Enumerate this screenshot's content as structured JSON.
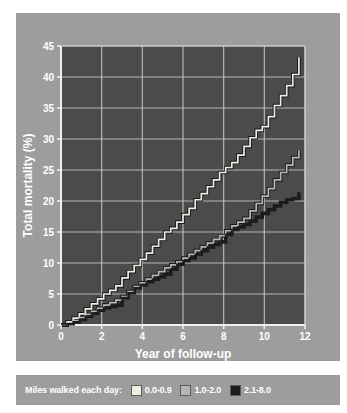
{
  "chart_data": {
    "type": "line",
    "title": "",
    "xlabel": "Year of follow-up",
    "ylabel": "Total mortality (%)",
    "xlim": [
      0,
      12
    ],
    "ylim": [
      0,
      45
    ],
    "xticks": [
      0,
      2,
      4,
      6,
      8,
      10,
      12
    ],
    "yticks": [
      0,
      5,
      10,
      15,
      20,
      25,
      30,
      35,
      40,
      45
    ],
    "grid": true,
    "legend_position": "below",
    "legend_title": "Miles walked each day:",
    "plot_background": "#4b4b4b",
    "panel_background": "#9d9d9d",
    "grid_color": "#c9c9c9",
    "step_interpolation": "step-after",
    "series": [
      {
        "name": "0.0-0.9",
        "color": "#f0ece1",
        "outline_color": "#1a1a1a",
        "x": [
          0.0,
          0.3,
          0.6,
          0.9,
          1.2,
          1.5,
          1.8,
          2.1,
          2.4,
          2.7,
          3.0,
          3.3,
          3.6,
          3.9,
          4.2,
          4.5,
          4.8,
          5.1,
          5.4,
          5.7,
          6.0,
          6.3,
          6.6,
          6.9,
          7.2,
          7.5,
          7.8,
          8.1,
          8.4,
          8.7,
          9.0,
          9.3,
          9.6,
          9.9,
          10.2,
          10.5,
          10.8,
          11.1,
          11.4,
          11.7
        ],
        "y": [
          0.0,
          0.5,
          1.1,
          1.8,
          2.6,
          3.4,
          4.2,
          5.0,
          5.6,
          6.3,
          7.6,
          8.6,
          9.6,
          10.6,
          11.6,
          12.7,
          13.8,
          15.0,
          15.6,
          16.6,
          17.8,
          18.8,
          20.2,
          21.2,
          22.3,
          23.4,
          24.6,
          25.4,
          26.2,
          27.4,
          28.8,
          30.2,
          31.4,
          32.0,
          33.6,
          35.4,
          37.0,
          38.6,
          40.4,
          43.2
        ]
      },
      {
        "name": "1.0-2.0",
        "color": "#b6b6b6",
        "outline_color": "#1a1a1a",
        "x": [
          0.0,
          0.3,
          0.6,
          0.9,
          1.2,
          1.5,
          1.8,
          2.1,
          2.4,
          2.7,
          3.0,
          3.3,
          3.6,
          3.9,
          4.2,
          4.5,
          4.8,
          5.1,
          5.4,
          5.7,
          6.0,
          6.3,
          6.6,
          6.9,
          7.2,
          7.5,
          7.8,
          8.1,
          8.4,
          8.7,
          9.0,
          9.3,
          9.6,
          9.9,
          10.2,
          10.5,
          10.8,
          11.1,
          11.4,
          11.7
        ],
        "y": [
          0.0,
          0.3,
          0.7,
          1.2,
          1.7,
          2.2,
          2.7,
          3.2,
          3.6,
          4.0,
          4.6,
          5.4,
          6.2,
          6.8,
          7.4,
          8.0,
          8.6,
          9.2,
          9.7,
          10.2,
          10.8,
          11.4,
          12.0,
          12.6,
          13.2,
          13.8,
          14.4,
          15.2,
          16.0,
          16.6,
          17.2,
          18.4,
          19.6,
          20.8,
          22.0,
          23.4,
          24.6,
          25.8,
          27.0,
          28.2
        ]
      },
      {
        "name": "2.1-8.0",
        "color": "#1c1c1c",
        "outline_color": "#1c1c1c",
        "x": [
          0.0,
          0.3,
          0.6,
          0.9,
          1.2,
          1.5,
          1.8,
          2.1,
          2.4,
          2.7,
          3.0,
          3.3,
          3.6,
          3.9,
          4.2,
          4.5,
          4.8,
          5.1,
          5.4,
          5.7,
          6.0,
          6.3,
          6.6,
          6.9,
          7.2,
          7.5,
          7.8,
          8.1,
          8.4,
          8.7,
          9.0,
          9.3,
          9.6,
          9.9,
          10.2,
          10.5,
          10.8,
          11.1,
          11.4,
          11.7
        ],
        "y": [
          0.0,
          0.2,
          0.5,
          0.9,
          1.4,
          1.9,
          2.4,
          2.8,
          3.0,
          3.2,
          4.4,
          5.2,
          6.0,
          6.5,
          7.0,
          7.4,
          7.8,
          8.2,
          9.0,
          9.8,
          10.4,
          10.8,
          11.4,
          12.0,
          12.6,
          13.0,
          13.4,
          14.6,
          15.4,
          15.8,
          16.2,
          16.8,
          17.4,
          18.0,
          18.6,
          19.2,
          19.8,
          20.2,
          20.4,
          21.4
        ]
      }
    ]
  },
  "legend": {
    "title": "Miles walked each day:",
    "entries": [
      {
        "label": "0.0-0.9",
        "color": "#f0ece1"
      },
      {
        "label": "1.0-2.0",
        "color": "#b6b6b6"
      },
      {
        "label": "2.1-8.0",
        "color": "#1c1c1c"
      }
    ]
  },
  "axes": {
    "x_title": "Year of follow-up",
    "y_title": "Total mortality (%)",
    "x_tick_labels": [
      "0",
      "2",
      "4",
      "6",
      "8",
      "10",
      "12"
    ],
    "y_tick_labels": [
      "0",
      "5",
      "10",
      "15",
      "20",
      "25",
      "30",
      "35",
      "40",
      "45"
    ]
  }
}
